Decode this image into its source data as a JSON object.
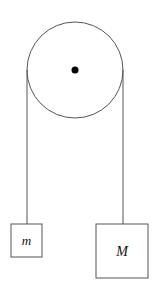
{
  "diagram": {
    "type": "atwood-machine",
    "pulley": {
      "axle": "pulley-axle-dot"
    },
    "masses": [
      {
        "id": "small",
        "label": "m"
      },
      {
        "id": "large",
        "label": "M"
      }
    ],
    "colors": {
      "stroke": "#555555",
      "axle": "#000000",
      "text": "#111111"
    }
  }
}
